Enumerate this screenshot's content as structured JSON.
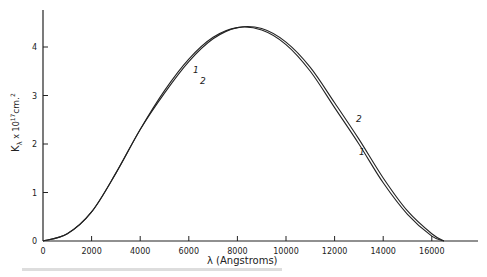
{
  "chart_data": {
    "type": "line",
    "title": "",
    "xlabel": "λ (Angstroms)",
    "ylabel": "Kλ x 10^17 cm^2",
    "xlim": [
      0,
      18000
    ],
    "ylim": [
      0,
      4.7
    ],
    "grid": false,
    "x_ticks": [
      "0",
      "2000",
      "4000",
      "6000",
      "8000",
      "10000",
      "12000",
      "14000",
      "16000"
    ],
    "y_ticks": [
      "0",
      "1",
      "2",
      "3",
      "4"
    ],
    "series": [
      {
        "name": "1",
        "x": [
          0,
          1000,
          2000,
          3000,
          4000,
          5000,
          6000,
          7000,
          8000,
          9000,
          10000,
          11000,
          12000,
          13000,
          14000,
          15000,
          16000,
          16500
        ],
        "values": [
          0,
          0.15,
          0.6,
          1.4,
          2.3,
          3.1,
          3.75,
          4.2,
          4.4,
          4.35,
          4.05,
          3.5,
          2.75,
          2.0,
          1.2,
          0.55,
          0.1,
          0
        ]
      },
      {
        "name": "2",
        "x": [
          0,
          1000,
          2000,
          3000,
          4000,
          5000,
          6000,
          7000,
          8000,
          9000,
          10000,
          11000,
          12000,
          13000,
          14000,
          15000,
          16000,
          16500
        ],
        "values": [
          0,
          0.15,
          0.6,
          1.4,
          2.3,
          3.05,
          3.7,
          4.17,
          4.4,
          4.38,
          4.1,
          3.58,
          2.85,
          2.1,
          1.3,
          0.62,
          0.15,
          0
        ]
      }
    ],
    "annotations": [
      {
        "text": "1",
        "near": "rising edge, upper"
      },
      {
        "text": "2",
        "near": "rising edge, lower"
      },
      {
        "text": "2",
        "near": "falling edge, upper"
      },
      {
        "text": "1",
        "near": "falling edge, lower"
      }
    ]
  },
  "labels": {
    "xlabel": "λ (Angstroms)",
    "ylabel_main": "K",
    "ylabel_sub": "λ",
    "ylabel_rest": " x 10",
    "ylabel_exp": "17",
    "ylabel_unit": "cm.",
    "ylabel_unit_exp": "2",
    "curve_1": "1",
    "curve_2": "2"
  }
}
